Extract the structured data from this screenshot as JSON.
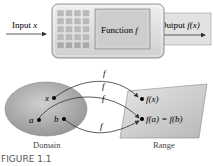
{
  "machine": {
    "input_label": "Input ",
    "input_var": "x",
    "function_label": "Function ",
    "function_var": "f",
    "output_label": "Output ",
    "output_expr": "f(x)"
  },
  "mapping": {
    "arrow_labels": [
      "f",
      "f",
      "f",
      "f"
    ],
    "domain_points": [
      "x",
      "a",
      "b"
    ],
    "range_points": [
      "f(x)",
      "f(a) = f(b)"
    ],
    "domain_label": "Domain",
    "range_label": "Range"
  },
  "caption": "FIGURE 1.1",
  "colors": {
    "machine_body": "#dcdcdc",
    "screen": "#c8c8c8",
    "domain_fill": "#a8a8a8",
    "range_fill": "#cfcfcf",
    "stroke": "#333333"
  }
}
